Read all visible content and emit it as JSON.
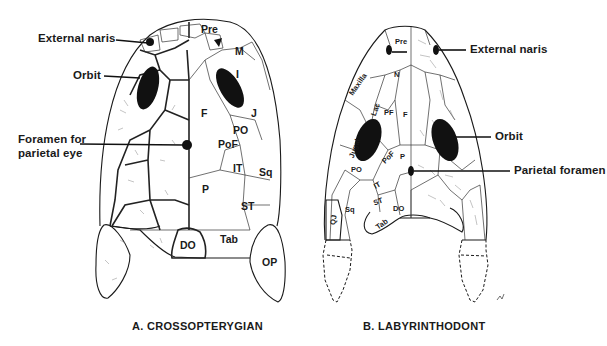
{
  "figure": {
    "panels": [
      {
        "id": "A",
        "caption": "A. CROSSOPTERYGIAN",
        "callouts": {
          "external_naris": "External naris",
          "orbit": "Orbit",
          "foramen_line1": "Foramen for",
          "foramen_line2": "parietal eye"
        },
        "bones": {
          "pre": "Pre",
          "m": "M",
          "i": "I",
          "f": "F",
          "j": "J",
          "po": "PO",
          "pof": "PoF",
          "it": "IT",
          "sq": "Sq",
          "p": "P",
          "st": "ST",
          "do": "DO",
          "tab": "Tab",
          "op": "OP"
        }
      },
      {
        "id": "B",
        "caption": "B. LABYRINTHODONT",
        "callouts": {
          "external_naris": "External naris",
          "orbit": "Orbit",
          "parietal_foramen": "Parietal foramen"
        },
        "bones": {
          "pre": "Pre",
          "n": "N",
          "maxilla": "Maxilla",
          "lac": "Lac",
          "pf": "PF",
          "f": "F",
          "jugal": "Jugal",
          "pof": "PoF",
          "p": "P",
          "po": "PO",
          "it": "IT",
          "st": "ST",
          "sq": "Sq",
          "qj": "QJ",
          "do": "DO",
          "tab": "Tab"
        }
      }
    ]
  }
}
